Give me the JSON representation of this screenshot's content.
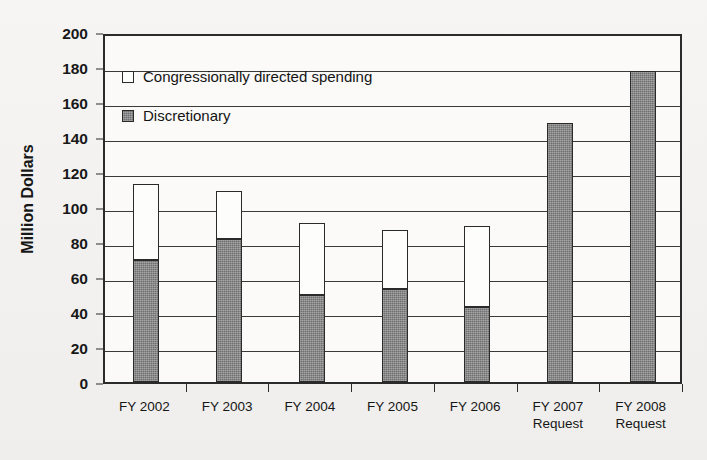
{
  "chart_data": {
    "type": "bar",
    "subtype": "stacked-vertical",
    "title": "",
    "xlabel": "",
    "ylabel": "Million Dollars",
    "ylim": [
      0,
      200
    ],
    "yticks": [
      0,
      20,
      40,
      60,
      80,
      100,
      120,
      140,
      160,
      180,
      200
    ],
    "ytick_labels": [
      "0",
      "20",
      "40",
      "60",
      "80",
      "100",
      "120",
      "140",
      "160",
      "180",
      "200"
    ],
    "grid": true,
    "grid_axis": "y",
    "legend_position": "upper-left-inside",
    "categories": [
      "FY 2002",
      "FY 2003",
      "FY 2004",
      "FY 2005",
      "FY 2006",
      "FY 2007 Request",
      "FY 2008 Request"
    ],
    "category_labels": [
      {
        "line1": "FY 2002",
        "line2": ""
      },
      {
        "line1": "FY 2003",
        "line2": ""
      },
      {
        "line1": "FY 2004",
        "line2": ""
      },
      {
        "line1": "FY 2005",
        "line2": ""
      },
      {
        "line1": "FY 2006",
        "line2": ""
      },
      {
        "line1": "FY 2007",
        "line2": "Request"
      },
      {
        "line1": "FY 2008",
        "line2": "Request"
      }
    ],
    "series": [
      {
        "name": "Discretionary",
        "color": "#6f6f6f",
        "values": [
          70,
          82,
          50,
          53,
          43,
          148,
          178
        ]
      },
      {
        "name": "Congressionally directed spending",
        "color": "#fdfdfc",
        "values": [
          43,
          27,
          41,
          34,
          46,
          0,
          0
        ]
      }
    ],
    "totals": [
      113,
      109,
      91,
      87,
      89,
      148,
      178
    ]
  },
  "legend": {
    "items": [
      {
        "label": "Congressionally directed spending",
        "swatch": "congressional"
      },
      {
        "label": "Discretionary",
        "swatch": "discretionary"
      }
    ]
  }
}
